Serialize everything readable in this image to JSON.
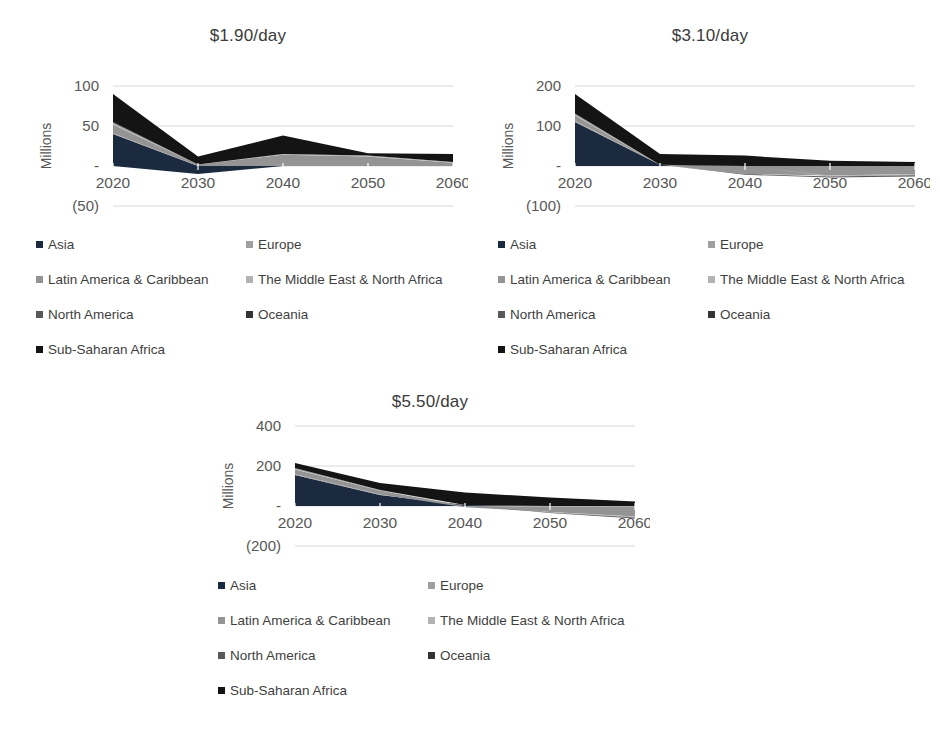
{
  "figure": {
    "background": "#ffffff",
    "gridline_color": "#d9d9d9",
    "text_color": "#3f3f3f"
  },
  "legend": {
    "items": [
      {
        "label": "Asia",
        "color": "#1b2a3e"
      },
      {
        "label": "Europe",
        "color": "#a0a0a0"
      },
      {
        "label": "Latin America & Caribbean",
        "color": "#949494"
      },
      {
        "label": "The Middle East & North Africa",
        "color": "#b3b3b3"
      },
      {
        "label": "North America",
        "color": "#595959"
      },
      {
        "label": "Oceania",
        "color": "#333333"
      },
      {
        "label": "Sub-Saharan Africa",
        "color": "#141414"
      }
    ]
  },
  "chart_data": [
    {
      "type": "area",
      "stacked": true,
      "title": "$1.90/day",
      "xlabel": "",
      "ylabel": "Millions",
      "categories": [
        "2020",
        "2030",
        "2040",
        "2050",
        "2060"
      ],
      "ylim": [
        -50,
        100
      ],
      "yticks": [
        {
          "value": 100,
          "label": "100"
        },
        {
          "value": 50,
          "label": "50"
        },
        {
          "value": 0,
          "label": "-"
        },
        {
          "value": -50,
          "label": "(50)"
        }
      ],
      "grid": true,
      "legend_position": "bottom",
      "series": [
        {
          "name": "Asia",
          "values": [
            40,
            -10,
            0,
            0,
            0
          ]
        },
        {
          "name": "Europe",
          "values": [
            1,
            0,
            0,
            0,
            0
          ]
        },
        {
          "name": "Latin America & Caribbean",
          "values": [
            11,
            2,
            14,
            12,
            4
          ]
        },
        {
          "name": "The Middle East & North Africa",
          "values": [
            2,
            0,
            1,
            1,
            1
          ]
        },
        {
          "name": "North America",
          "values": [
            0,
            0,
            0,
            0,
            0
          ]
        },
        {
          "name": "Oceania",
          "values": [
            1,
            0,
            0,
            0,
            0
          ]
        },
        {
          "name": "Sub-Saharan Africa",
          "values": [
            35,
            10,
            23,
            3,
            10
          ]
        }
      ]
    },
    {
      "type": "area",
      "stacked": true,
      "title": "$3.10/day",
      "xlabel": "",
      "ylabel": "Millions",
      "categories": [
        "2020",
        "2030",
        "2040",
        "2050",
        "2060"
      ],
      "ylim": [
        -100,
        200
      ],
      "yticks": [
        {
          "value": 200,
          "label": "200"
        },
        {
          "value": 100,
          "label": "100"
        },
        {
          "value": 0,
          "label": "-"
        },
        {
          "value": -100,
          "label": "(100)"
        }
      ],
      "grid": true,
      "legend_position": "bottom",
      "series": [
        {
          "name": "Asia",
          "values": [
            110,
            3,
            0,
            0,
            0
          ]
        },
        {
          "name": "Europe",
          "values": [
            3,
            0,
            0,
            0,
            0
          ]
        },
        {
          "name": "Latin America & Caribbean",
          "values": [
            13,
            0,
            -20,
            -24,
            -20
          ]
        },
        {
          "name": "The Middle East & North Africa",
          "values": [
            4,
            0,
            0,
            -2,
            -3
          ]
        },
        {
          "name": "North America",
          "values": [
            0,
            0,
            -2,
            -3,
            -3
          ]
        },
        {
          "name": "Oceania",
          "values": [
            1,
            0,
            0,
            0,
            0
          ]
        },
        {
          "name": "Sub-Saharan Africa",
          "values": [
            49,
            27,
            26,
            13,
            10
          ]
        }
      ]
    },
    {
      "type": "area",
      "stacked": true,
      "title": "$5.50/day",
      "xlabel": "",
      "ylabel": "Millions",
      "categories": [
        "2020",
        "2030",
        "2040",
        "2050",
        "2060"
      ],
      "ylim": [
        -200,
        400
      ],
      "yticks": [
        {
          "value": 400,
          "label": "400"
        },
        {
          "value": 200,
          "label": "200"
        },
        {
          "value": 0,
          "label": "-"
        },
        {
          "value": -200,
          "label": "(200)"
        }
      ],
      "grid": true,
      "legend_position": "bottom",
      "series": [
        {
          "name": "Asia",
          "values": [
            155,
            55,
            5,
            0,
            0
          ]
        },
        {
          "name": "Europe",
          "values": [
            4,
            2,
            0,
            -2,
            -4
          ]
        },
        {
          "name": "Latin America & Caribbean",
          "values": [
            24,
            20,
            -6,
            -28,
            -48
          ]
        },
        {
          "name": "The Middle East & North Africa",
          "values": [
            5,
            3,
            0,
            -3,
            -6
          ]
        },
        {
          "name": "North America",
          "values": [
            1,
            0,
            0,
            -2,
            -5
          ]
        },
        {
          "name": "Oceania",
          "values": [
            1,
            0,
            0,
            0,
            0
          ]
        },
        {
          "name": "Sub-Saharan Africa",
          "values": [
            25,
            35,
            63,
            42,
            22
          ]
        }
      ]
    }
  ]
}
